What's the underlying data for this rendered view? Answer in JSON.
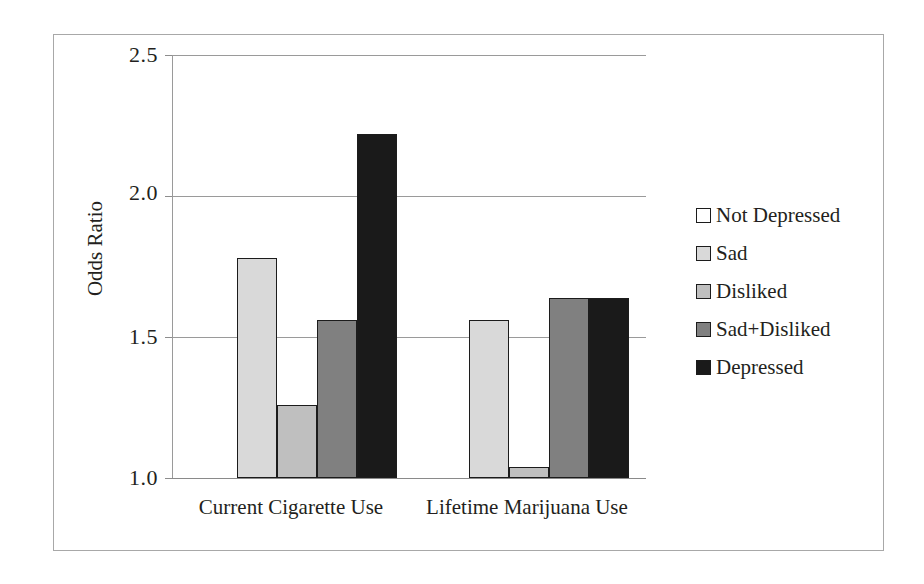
{
  "chart_data": {
    "type": "bar",
    "title": "",
    "xlabel": "",
    "ylabel": "Odds Ratio",
    "categories": [
      "Current Cigarette Use",
      "Lifetime Marijuana Use"
    ],
    "series": [
      {
        "name": "Not Depressed",
        "color": "#ffffff",
        "values": [
          1.0,
          1.0
        ]
      },
      {
        "name": "Sad",
        "color": "#d9d9d9",
        "values": [
          1.78,
          1.56
        ]
      },
      {
        "name": "Disliked",
        "color": "#bfbfbf",
        "values": [
          1.26,
          1.04
        ]
      },
      {
        "name": "Sad+Disliked",
        "color": "#808080",
        "values": [
          1.56,
          1.64
        ]
      },
      {
        "name": "Depressed",
        "color": "#1a1a1a",
        "values": [
          2.22,
          1.64
        ]
      }
    ],
    "ylim": [
      1.0,
      2.5
    ],
    "yticks": [
      1.0,
      1.5,
      2.0,
      2.5
    ],
    "ytick_labels": [
      "1.0",
      "1.5",
      "2.0",
      "2.5"
    ],
    "grid": true,
    "legend_position": "right",
    "baseline": 1.0
  },
  "axis": {
    "y_title": "Odds Ratio"
  },
  "legend": {
    "items": [
      {
        "label": "Not Depressed"
      },
      {
        "label": "Sad"
      },
      {
        "label": "Disliked"
      },
      {
        "label": "Sad+Disliked"
      },
      {
        "label": "Depressed"
      }
    ]
  }
}
